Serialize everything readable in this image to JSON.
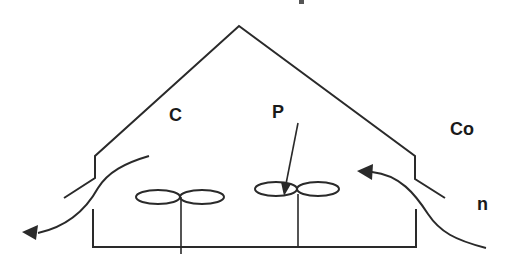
{
  "diagram": {
    "type": "greenhouse-ventilation-schematic",
    "labels": {
      "c": "C",
      "p": "P",
      "co": "Co",
      "n": "n"
    },
    "colors": {
      "stroke": "#2a2a2a",
      "background": "#ffffff"
    },
    "elements": {
      "roof": "gabled roof with eave steps",
      "walls": "left and right side walls",
      "floor": "base floor line",
      "fans": [
        "left-fan",
        "right-fan"
      ],
      "airflow": [
        "inflow-arrow-right",
        "outflow-arrow-left"
      ],
      "pointer": "arrow from P to right fan"
    }
  }
}
